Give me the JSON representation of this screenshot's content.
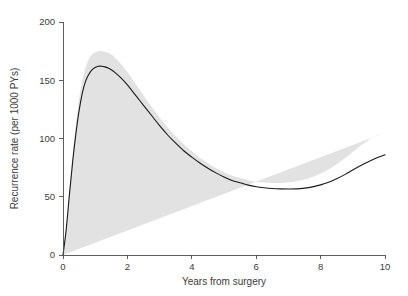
{
  "chart_data": {
    "type": "line",
    "title": "",
    "subtitle": "",
    "xlabel": "Years from surgery",
    "ylabel": "Recurrence rate (per 1000 PYs)",
    "xlim": [
      0,
      10
    ],
    "ylim": [
      0,
      200
    ],
    "xticks": [
      0,
      2,
      4,
      6,
      8,
      10
    ],
    "xtick_labels": [
      "0",
      "2",
      "4",
      "6",
      "8",
      "10"
    ],
    "yticks": [
      0,
      50,
      100,
      150,
      200
    ],
    "ytick_labels": [
      "0",
      "50",
      "100",
      "150",
      "200"
    ],
    "grid": false,
    "legend": null,
    "legend_position": "none",
    "annotations": [],
    "series": [
      {
        "name": "Recurrence rate",
        "kind": "line",
        "color": "#1a1a1a",
        "x": [
          0.0,
          0.1,
          0.2,
          0.3,
          0.4,
          0.5,
          0.6,
          0.7,
          0.8,
          0.9,
          1.0,
          1.1,
          1.2,
          1.3,
          1.4,
          1.5,
          1.6,
          1.8,
          2.0,
          2.2,
          2.4,
          2.6,
          2.8,
          3.0,
          3.25,
          3.5,
          3.75,
          4.0,
          4.25,
          4.5,
          4.75,
          5.0,
          5.25,
          5.5,
          5.75,
          6.0,
          6.25,
          6.5,
          6.75,
          7.0,
          7.25,
          7.5,
          7.75,
          8.0,
          8.25,
          8.5,
          8.75,
          9.0,
          9.25,
          9.5,
          9.75,
          10.0
        ],
        "values": [
          0.0,
          22.0,
          52.0,
          80.0,
          104.0,
          124.0,
          139.0,
          149.0,
          155.0,
          159.0,
          161.0,
          162.0,
          162.0,
          161.5,
          160.5,
          159.0,
          157.0,
          152.0,
          146.0,
          139.0,
          132.0,
          125.0,
          118.0,
          111.0,
          103.0,
          96.0,
          89.5,
          84.0,
          79.0,
          74.5,
          70.5,
          67.0,
          64.0,
          62.0,
          60.0,
          58.6,
          57.7,
          57.1,
          56.8,
          56.7,
          56.8,
          57.4,
          58.5,
          60.2,
          62.5,
          65.5,
          69.0,
          73.0,
          76.8,
          80.3,
          83.4,
          86.0
        ]
      }
    ],
    "confidence_band": {
      "name": "95% confidence interval",
      "color": "#e2e2e2",
      "x": [
        0.0,
        0.1,
        0.2,
        0.3,
        0.4,
        0.5,
        0.6,
        0.7,
        0.8,
        0.9,
        1.0,
        1.1,
        1.2,
        1.3,
        1.4,
        1.5,
        1.6,
        1.8,
        2.0,
        2.2,
        2.4,
        2.6,
        2.8,
        3.0,
        3.25,
        3.5,
        3.75,
        4.0,
        4.25,
        4.5,
        4.75,
        5.0,
        5.25,
        5.5,
        5.75,
        6.0,
        6.25,
        6.5,
        6.75,
        7.0,
        7.25,
        7.5,
        7.75,
        8.0,
        8.25,
        8.5,
        8.75,
        9.0,
        9.25,
        9.5,
        9.75,
        10.0
      ],
      "upper": [
        0.0,
        24.0,
        56.0,
        86.0,
        112.0,
        134.0,
        150.0,
        161.0,
        168.0,
        172.0,
        174.0,
        175.0,
        175.0,
        174.5,
        173.5,
        172.0,
        170.0,
        164.0,
        157.0,
        149.0,
        141.0,
        133.0,
        125.5,
        118.0,
        109.5,
        102.0,
        95.0,
        89.0,
        83.5,
        78.8,
        74.6,
        71.0,
        68.0,
        66.0,
        64.2,
        62.9,
        62.2,
        61.8,
        61.8,
        62.2,
        63.2,
        64.8,
        67.0,
        70.0,
        73.5,
        78.0,
        83.0,
        88.5,
        94.0,
        99.0,
        102.5,
        105.0
      ],
      "lower": [
        0.0,
        20.0,
        48.0,
        74.0,
        96.0,
        114.0,
        128.0,
        137.0,
        143.0,
        147.0,
        149.0,
        150.0,
        150.0,
        149.5,
        148.5,
        147.0,
        145.0,
        141.0,
        136.0,
        130.0,
        124.0,
        117.5,
        111.0,
        104.5,
        97.0,
        90.5,
        84.5,
        79.5,
        75.0,
        70.8,
        67.0,
        63.5,
        60.5,
        58.2,
        56.0,
        54.4,
        53.2,
        52.4,
        51.8,
        51.3,
        50.8,
        50.4,
        50.2,
        50.4,
        51.0,
        52.0,
        53.5,
        55.5,
        57.8,
        59.5,
        60.3,
        60.5
      ]
    }
  },
  "axes": {
    "x_title": "Years from surgery",
    "y_title": "Recurrence rate (per 1000 PYs)"
  }
}
